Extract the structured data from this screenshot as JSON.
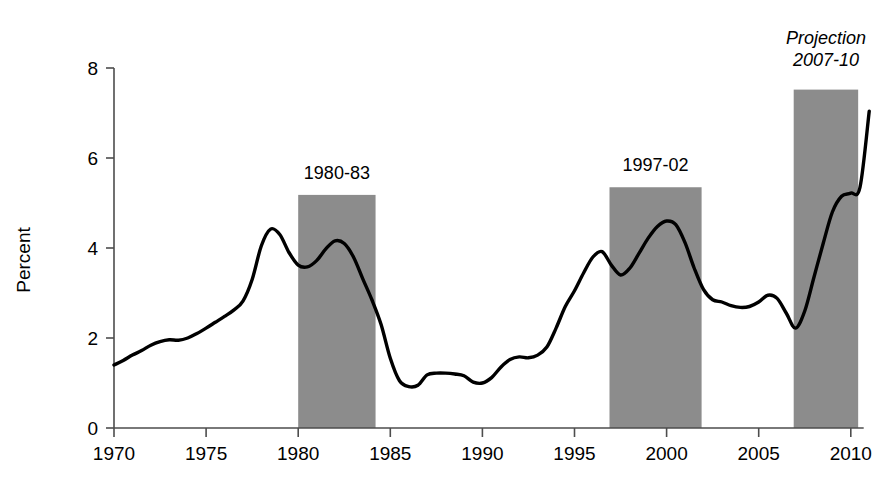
{
  "chart_data": {
    "type": "line",
    "title": "",
    "xlabel": "",
    "ylabel": "Percent",
    "xlim": [
      1970,
      2011
    ],
    "ylim": [
      0,
      8
    ],
    "grid": false,
    "legend_position": "none",
    "ytick_labels": [
      "0",
      "2",
      "4",
      "6",
      "8"
    ],
    "ytick_values": [
      0,
      2,
      4,
      6,
      8
    ],
    "xtick_labels": [
      "1970",
      "1975",
      "1980",
      "1985",
      "1990",
      "1995",
      "2000",
      "2005",
      "2010"
    ],
    "xtick_values": [
      1970,
      1975,
      1980,
      1985,
      1990,
      1995,
      2000,
      2005,
      2010
    ],
    "series": [
      {
        "name": "Percent",
        "x": [
          1970,
          1970.5,
          1971,
          1971.5,
          1972,
          1972.5,
          1973,
          1973.5,
          1974,
          1974.5,
          1975,
          1975.5,
          1976,
          1976.5,
          1977,
          1977.5,
          1978,
          1978.5,
          1979,
          1979.5,
          1980,
          1980.5,
          1981,
          1981.5,
          1982,
          1982.5,
          1983,
          1983.5,
          1984,
          1984.5,
          1985,
          1985.5,
          1986,
          1986.5,
          1987,
          1987.5,
          1988,
          1988.5,
          1989,
          1989.5,
          1990,
          1990.5,
          1991,
          1991.5,
          1992,
          1992.5,
          1993,
          1993.5,
          1994,
          1994.5,
          1995,
          1995.5,
          1996,
          1996.5,
          1997,
          1997.5,
          1998,
          1998.5,
          1999,
          1999.5,
          2000,
          2000.5,
          2001,
          2001.5,
          2002,
          2002.5,
          2003,
          2003.5,
          2004,
          2004.5,
          2005,
          2005.5,
          2006,
          2006.5,
          2007,
          2007.5,
          2008,
          2008.5,
          2009,
          2009.5,
          2010,
          2010.5,
          2011
        ],
        "values": [
          1.4,
          1.5,
          1.62,
          1.72,
          1.84,
          1.92,
          1.96,
          1.95,
          2.0,
          2.1,
          2.22,
          2.35,
          2.48,
          2.62,
          2.82,
          3.3,
          4.05,
          4.42,
          4.3,
          3.9,
          3.62,
          3.58,
          3.72,
          3.98,
          4.16,
          4.1,
          3.8,
          3.32,
          2.85,
          2.3,
          1.55,
          1.05,
          0.92,
          0.95,
          1.18,
          1.22,
          1.22,
          1.2,
          1.16,
          1.02,
          1.0,
          1.12,
          1.35,
          1.52,
          1.58,
          1.56,
          1.62,
          1.8,
          2.22,
          2.7,
          3.05,
          3.45,
          3.8,
          3.92,
          3.62,
          3.4,
          3.55,
          3.88,
          4.22,
          4.48,
          4.6,
          4.52,
          4.12,
          3.55,
          3.08,
          2.85,
          2.8,
          2.72,
          2.68,
          2.7,
          2.8,
          2.95,
          2.88,
          2.55,
          2.22,
          2.6,
          3.35,
          4.1,
          4.8,
          5.15,
          5.22,
          5.35,
          7.04
        ],
        "color": "#000000"
      }
    ],
    "shaded_bands": [
      {
        "label": "1980-83",
        "x_start": 1980.0,
        "x_end": 1984.2,
        "y_top": 5.18,
        "color": "#8c8c8c"
      },
      {
        "label": "1997-02",
        "x_start": 1996.9,
        "x_end": 2001.9,
        "y_top": 5.35,
        "color": "#8c8c8c"
      },
      {
        "label": "Projection",
        "label_line2": "2007-10",
        "x_start": 2006.9,
        "x_end": 2010.4,
        "y_top": 7.52,
        "color": "#8c8c8c",
        "italic": true
      }
    ],
    "axis_color": "#4d4d4d",
    "line_color": "#000000",
    "band_color": "#8c8c8c",
    "background": "#ffffff"
  }
}
